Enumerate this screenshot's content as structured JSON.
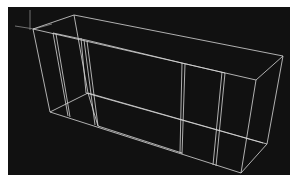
{
  "viewport": {
    "background": "#111111",
    "edge_color": "#d8d8d8",
    "axis_color": "#8a8a8a",
    "description": "3D wireframe view of a tapered box-shaped model with internal partition frames"
  }
}
